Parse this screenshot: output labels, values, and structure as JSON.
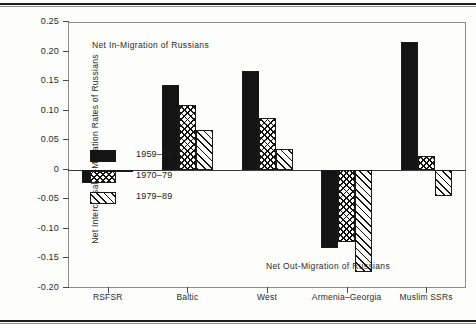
{
  "figure": {
    "y_axis_title": "Net Intercensal In-Migration Rates of Russians",
    "annotation_top": "Net In-Migration of Russians",
    "annotation_bottom": "Net Out-Migration of Russians"
  },
  "legend": {
    "items": [
      {
        "label": "1959–70",
        "pattern": "solid-black",
        "swatch": "s0"
      },
      {
        "label": "1970–79",
        "pattern": "cross-hatch",
        "swatch": "s1"
      },
      {
        "label": "1979–89",
        "pattern": "diagonal-hatch",
        "swatch": "s2"
      }
    ]
  },
  "chart_data": {
    "type": "bar",
    "title": "",
    "xlabel": "",
    "ylabel": "Net Intercensal In-Migration Rates of Russians",
    "ylim": [
      -0.2,
      0.25
    ],
    "yticks": [
      0.25,
      0.2,
      0.15,
      0.1,
      0.05,
      0,
      -0.05,
      -0.1,
      -0.15,
      -0.2
    ],
    "ytick_labels": [
      "0.25",
      "0.20",
      "0.15",
      "0.10",
      "0.05",
      "0",
      "-0.05",
      "-0.10",
      "-0.15",
      "-0.20"
    ],
    "grid": false,
    "legend_position": "inside-lower-left",
    "categories": [
      "RSFSR",
      "Baltic",
      "West",
      "Armenia–Georgia",
      "Muslim SSRs"
    ],
    "series": [
      {
        "name": "1959–70",
        "values": [
          -0.023,
          0.143,
          0.167,
          -0.133,
          0.217
        ]
      },
      {
        "name": "1970–79",
        "values": [
          -0.007,
          0.11,
          0.088,
          -0.122,
          0.023
        ]
      },
      {
        "name": "1979–89",
        "values": [
          -0.002,
          0.068,
          0.035,
          -0.173,
          -0.045
        ]
      }
    ],
    "annotations": [
      {
        "text": "Net In-Migration of Russians",
        "region": "upper-left"
      },
      {
        "text": "Net Out-Migration of Russians",
        "region": "lower-right"
      }
    ]
  }
}
